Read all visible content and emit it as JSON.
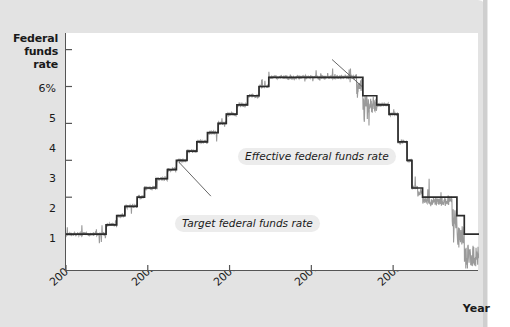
{
  "figure": {
    "y_axis_title_lines": [
      "Federal",
      "funds",
      "rate"
    ],
    "x_axis_title": "Year",
    "callouts": {
      "effective": "Effective federal funds rate",
      "target": "Target federal funds rate"
    }
  },
  "chart_data": {
    "type": "line",
    "title": "",
    "subtitle": "",
    "xlabel": "Year",
    "ylabel": "Federal funds rate",
    "xlim": [
      2004.0,
      2009.05
    ],
    "ylim": [
      0,
      6.45
    ],
    "grid": false,
    "legend_position": "inline-annotations",
    "x_tick_labels": [
      "2004",
      "2005",
      "2006",
      "2007",
      "2008"
    ],
    "x_tick_values": [
      2004,
      2005,
      2006,
      2007,
      2008
    ],
    "y_tick_labels": [
      "6%",
      "5",
      "4",
      "3",
      "2",
      "1"
    ],
    "y_tick_values": [
      6,
      5,
      4,
      3,
      2,
      1
    ],
    "annotations": [
      {
        "text": "Effective federal funds rate",
        "points_to_x": 2007.62,
        "points_to_y": 5.0
      },
      {
        "text": "Target federal funds rate",
        "points_to_x": 2005.38,
        "points_to_y": 2.95
      }
    ],
    "series": [
      {
        "name": "Target federal funds rate",
        "color": "#2b2b2b",
        "style": "step",
        "x": [
          2004.0,
          2004.49,
          2004.49,
          2004.62,
          2004.62,
          2004.72,
          2004.72,
          2004.87,
          2004.87,
          2004.96,
          2004.96,
          2005.1,
          2005.1,
          2005.24,
          2005.24,
          2005.35,
          2005.35,
          2005.48,
          2005.48,
          2005.6,
          2005.6,
          2005.73,
          2005.73,
          2005.86,
          2005.86,
          2005.96,
          2005.96,
          2006.09,
          2006.09,
          2006.22,
          2006.22,
          2006.36,
          2006.36,
          2006.48,
          2006.48,
          2007.63,
          2007.63,
          2007.8,
          2007.8,
          2007.95,
          2007.95,
          2008.06,
          2008.06,
          2008.17,
          2008.17,
          2008.23,
          2008.23,
          2008.36,
          2008.36,
          2008.78,
          2008.78,
          2008.87,
          2008.87,
          2009.05
        ],
        "y": [
          1.0,
          1.0,
          1.25,
          1.25,
          1.5,
          1.5,
          1.75,
          1.75,
          2.0,
          2.0,
          2.25,
          2.25,
          2.5,
          2.5,
          2.75,
          2.75,
          3.0,
          3.0,
          3.25,
          3.25,
          3.5,
          3.5,
          3.75,
          3.75,
          4.0,
          4.0,
          4.25,
          4.25,
          4.5,
          4.5,
          4.75,
          4.75,
          5.0,
          5.0,
          5.25,
          5.25,
          4.75,
          4.75,
          4.5,
          4.5,
          4.25,
          4.25,
          3.5,
          3.5,
          3.0,
          3.0,
          2.25,
          2.25,
          2.0,
          2.0,
          1.5,
          1.5,
          1.0,
          1.0
        ]
      },
      {
        "name": "Effective federal funds rate",
        "color": "#9a9a9a",
        "style": "noisy-line",
        "note": "daily effective rate fluctuating about the target, with large downside spikes in late 2008"
      }
    ]
  }
}
